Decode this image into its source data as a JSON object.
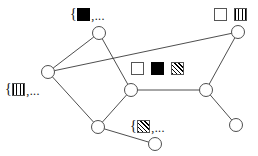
{
  "figure": {
    "width": 258,
    "height": 156,
    "background": "#ffffff",
    "stroke_color": "#3a3a3a",
    "text_color": "#111111"
  },
  "chart_data": {
    "type": "diagram",
    "subtype": "node-link-graph",
    "title": "",
    "node_radius": 6.5,
    "nodes": [
      {
        "id": "n1",
        "x": 99,
        "y": 33,
        "label": "top-node"
      },
      {
        "id": "n2",
        "x": 48,
        "y": 72,
        "label": "left-node"
      },
      {
        "id": "n3",
        "x": 131,
        "y": 90,
        "label": "center-node"
      },
      {
        "id": "n4",
        "x": 98,
        "y": 127,
        "label": "bottom-left-node"
      },
      {
        "id": "n5",
        "x": 155,
        "y": 144,
        "label": "bottom-node"
      },
      {
        "id": "n6",
        "x": 238,
        "y": 32,
        "label": "top-right-node"
      },
      {
        "id": "n7",
        "x": 206,
        "y": 90,
        "label": "right-middle-node"
      },
      {
        "id": "n8",
        "x": 236,
        "y": 125,
        "label": "bottom-right-node"
      }
    ],
    "edges": [
      {
        "source": "n1",
        "target": "n2"
      },
      {
        "source": "n1",
        "target": "n3"
      },
      {
        "source": "n2",
        "target": "n6"
      },
      {
        "source": "n2",
        "target": "n4"
      },
      {
        "source": "n3",
        "target": "n4"
      },
      {
        "source": "n3",
        "target": "n7"
      },
      {
        "source": "n4",
        "target": "n5"
      },
      {
        "source": "n6",
        "target": "n7"
      },
      {
        "source": "n7",
        "target": "n8"
      }
    ]
  },
  "annotations": {
    "top_set": {
      "name": "top-node-set-label",
      "open_brace": "{",
      "glyph": "solid-square",
      "tail": ",...",
      "x": 70,
      "y": 7
    },
    "left_set": {
      "name": "left-node-set-label",
      "open_brace": "{",
      "glyph": "vertical-hatch-square",
      "tail": ",...",
      "x": 5,
      "y": 82
    },
    "bottom_set": {
      "name": "bottom-node-set-label",
      "open_brace": "{",
      "glyph": "diagonal-hatch-square",
      "tail": ",...",
      "x": 130,
      "y": 119
    }
  },
  "legends": {
    "center_legend": {
      "name": "center-legend",
      "x": 131,
      "y": 62,
      "glyphs": [
        "empty-square",
        "solid-square",
        "diagonal-hatch-square"
      ]
    },
    "top_right_legend": {
      "name": "top-right-legend",
      "x": 214,
      "y": 8,
      "glyphs": [
        "empty-square",
        "vertical-hatch-square"
      ]
    }
  }
}
